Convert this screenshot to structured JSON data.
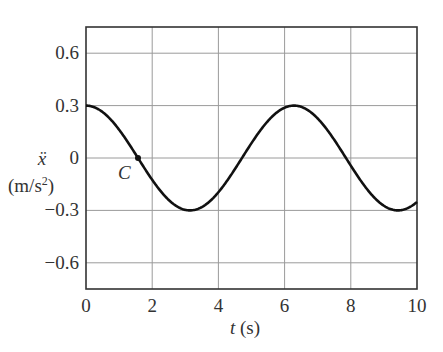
{
  "chart_data": {
    "type": "line",
    "title": "",
    "xlabel": "t (s)",
    "xlabel_var": "t",
    "xlabel_unit": "(s)",
    "ylabel": "ẍ (m/s²)",
    "ylabel_var": "ẍ",
    "ylabel_unit_base": "(m/s",
    "ylabel_unit_sup": "2",
    "ylabel_unit_end": ")",
    "xlim": [
      0,
      10
    ],
    "ylim": [
      -0.75,
      0.75
    ],
    "xticks": [
      "0",
      "2",
      "4",
      "6",
      "8",
      "10"
    ],
    "xtick_values": [
      0,
      2,
      4,
      6,
      8,
      10
    ],
    "yticks": [
      "0.6",
      "0.3",
      "0",
      "−0.3",
      "−0.6"
    ],
    "ytick_values": [
      0.6,
      0.3,
      0,
      -0.3,
      -0.6
    ],
    "grid": true,
    "legend": null,
    "series": [
      {
        "name": "acceleration",
        "function": "0.3*cos(t)",
        "amplitude": 0.3,
        "period": 6.283,
        "x": [
          0,
          0.5,
          1,
          1.5,
          1.571,
          2,
          2.5,
          3,
          3.142,
          3.5,
          4,
          4.5,
          5,
          5.5,
          6,
          6.283,
          6.5,
          7,
          7.5,
          8,
          8.5,
          9,
          9.425,
          9.5,
          10
        ],
        "values": [
          0.3,
          0.263,
          0.162,
          0.021,
          0.0,
          -0.125,
          -0.24,
          -0.297,
          -0.3,
          -0.281,
          -0.196,
          -0.063,
          0.085,
          0.213,
          0.288,
          0.3,
          0.293,
          0.226,
          0.104,
          -0.044,
          -0.181,
          -0.273,
          -0.3,
          -0.299,
          -0.252
        ]
      }
    ],
    "annotations": [
      {
        "label": "C",
        "t": 1.571,
        "value": 0.0,
        "marker": "dot"
      }
    ],
    "colors": {
      "curve": "#111111",
      "grid": "#9a9a9a",
      "frame": "#333333",
      "text": "#333333"
    }
  }
}
